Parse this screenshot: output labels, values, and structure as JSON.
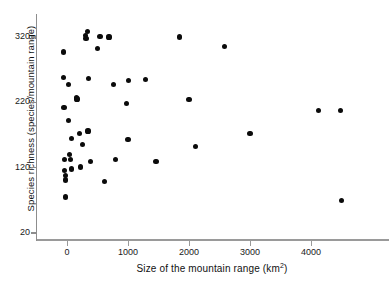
{
  "chart_data": {
    "type": "scatter",
    "title": "",
    "xlabel": "Size of the mountain range (km2)",
    "xlabel_base": "Size of the mountain range (km",
    "xlabel_sup": "2",
    "xlabel_tail": ")",
    "ylabel": "Species richness (species/mountain range)",
    "xlim": [
      -200,
      4900
    ],
    "ylim": [
      20,
      345
    ],
    "xticks": [
      0,
      1000,
      2000,
      3000,
      4000
    ],
    "xtick_labels": [
      "0",
      "1000",
      "2000",
      "3000",
      "4000"
    ],
    "yticks": [
      20,
      120,
      220,
      320
    ],
    "ytick_labels": [
      "20",
      "120",
      "220",
      "320"
    ],
    "grid": false,
    "legend": null,
    "marker": "filled-circle",
    "marker_color": "#0b0b0b",
    "axis_color": "#8d8d8d",
    "points": [
      {
        "x": -60,
        "y": 297
      },
      {
        "x": -55,
        "y": 258
      },
      {
        "x": -50,
        "y": 212
      },
      {
        "x": -40,
        "y": 133
      },
      {
        "x": -35,
        "y": 116
      },
      {
        "x": -30,
        "y": 108
      },
      {
        "x": -25,
        "y": 101
      },
      {
        "x": -20,
        "y": 75
      },
      {
        "x": 20,
        "y": 247
      },
      {
        "x": 30,
        "y": 192
      },
      {
        "x": 40,
        "y": 140
      },
      {
        "x": 55,
        "y": 133
      },
      {
        "x": 70,
        "y": 165
      },
      {
        "x": 80,
        "y": 118
      },
      {
        "x": 150,
        "y": 228
      },
      {
        "x": 165,
        "y": 225
      },
      {
        "x": 200,
        "y": 172
      },
      {
        "x": 215,
        "y": 121
      },
      {
        "x": 250,
        "y": 155
      },
      {
        "x": 300,
        "y": 322
      },
      {
        "x": 310,
        "y": 318
      },
      {
        "x": 330,
        "y": 328
      },
      {
        "x": 345,
        "y": 176
      },
      {
        "x": 355,
        "y": 257
      },
      {
        "x": 390,
        "y": 130
      },
      {
        "x": 500,
        "y": 303
      },
      {
        "x": 540,
        "y": 321
      },
      {
        "x": 610,
        "y": 99
      },
      {
        "x": 690,
        "y": 320
      },
      {
        "x": 760,
        "y": 247
      },
      {
        "x": 790,
        "y": 132
      },
      {
        "x": 980,
        "y": 218
      },
      {
        "x": 1000,
        "y": 163
      },
      {
        "x": 1010,
        "y": 253
      },
      {
        "x": 1290,
        "y": 255
      },
      {
        "x": 1460,
        "y": 130
      },
      {
        "x": 1850,
        "y": 320
      },
      {
        "x": 2000,
        "y": 224
      },
      {
        "x": 2110,
        "y": 152
      },
      {
        "x": 2580,
        "y": 306
      },
      {
        "x": 3000,
        "y": 172
      },
      {
        "x": 4120,
        "y": 208
      },
      {
        "x": 4480,
        "y": 208
      },
      {
        "x": 4500,
        "y": 70
      }
    ]
  }
}
